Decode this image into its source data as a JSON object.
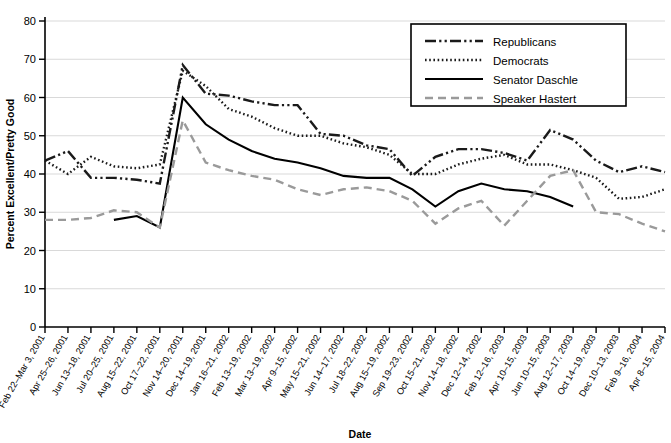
{
  "chart_data": {
    "type": "line",
    "title": "",
    "xlabel": "Date",
    "ylabel": "Percent Excellent/Pretty Good",
    "ylim": [
      0,
      80
    ],
    "yticks": [
      0,
      10,
      20,
      30,
      40,
      50,
      60,
      70,
      80
    ],
    "grid": true,
    "legend_position": "top-right",
    "categories": [
      "Feb 22–Mar 3, 2001",
      "Apr 25–26, 2001",
      "Jun 13–18, 2001",
      "Jul 20–25, 2001",
      "Aug 15–22, 2001",
      "Oct 17–22, 2001",
      "Nov 14–20, 2001",
      "Dec 14–19, 2001",
      "Jan 16–21, 2002",
      "Feb 13–19, 2002",
      "Mar 13–19, 2002",
      "Apr 9–15, 2002",
      "May 15–21, 2002",
      "Jun 14–17, 2002",
      "Jul 18–22, 2002",
      "Aug 15–19, 2002",
      "Sep 19–23, 2002",
      "Oct 15–21, 2002",
      "Nov 14–18, 2002",
      "Dec 12–14, 2002",
      "Feb 12–16, 2003",
      "Apr 10–15, 2003",
      "Jun 10–15, 2003",
      "Aug 12–17, 2003",
      "Oct 14–19, 2003",
      "Dec 10–13, 2003",
      "Feb 9–16, 2004",
      "Apr 8–15, 2004"
    ],
    "series": [
      {
        "name": "Republicans",
        "style": "dash-dot-dot",
        "color": "#1a1a1a",
        "values": [
          43.5,
          46,
          39,
          39,
          38.5,
          37.5,
          68.5,
          61,
          60.5,
          59,
          58,
          58,
          50.5,
          50,
          47.5,
          46.5,
          39.5,
          44.5,
          46.5,
          46.5,
          45.5,
          43.5,
          51.5,
          49,
          43.5,
          40.5,
          42,
          40.5
        ]
      },
      {
        "name": "Democrats",
        "style": "dotted",
        "color": "#1a1a1a",
        "values": [
          43.5,
          40,
          44.5,
          42,
          41.5,
          42.5,
          67,
          63,
          57,
          55,
          52,
          50,
          50,
          48,
          47,
          45,
          40,
          40,
          42.5,
          44,
          45,
          42.5,
          42.5,
          41,
          39,
          33.5,
          34,
          36
        ]
      },
      {
        "name": "Senator Daschle",
        "style": "solid",
        "color": "#000000",
        "values": [
          null,
          null,
          null,
          28,
          29,
          26,
          60,
          53,
          49,
          46,
          44,
          43,
          41.5,
          39.5,
          39,
          39,
          36,
          31.5,
          35.5,
          37.5,
          36,
          35.5,
          34,
          31.5,
          null,
          null,
          null,
          null
        ]
      },
      {
        "name": "Speaker Hastert",
        "style": "dashed",
        "color": "#9a9a9a",
        "values": [
          28,
          28,
          28.5,
          30.5,
          30,
          26,
          54,
          43,
          41,
          39.5,
          38.5,
          36,
          34.5,
          36,
          36.5,
          35.5,
          33,
          27,
          31,
          33,
          26.5,
          33,
          39.5,
          41,
          30,
          29.5,
          27,
          25
        ]
      }
    ]
  },
  "axes": {
    "y_title": "Percent Excellent/Pretty Good",
    "x_title": "Date",
    "y_tick_labels": [
      "0",
      "10",
      "20",
      "30",
      "40",
      "50",
      "60",
      "70",
      "80"
    ]
  },
  "legend": {
    "items": [
      {
        "label": "Republicans"
      },
      {
        "label": "Democrats"
      },
      {
        "label": "Senator Daschle"
      },
      {
        "label": "Speaker Hastert"
      }
    ]
  }
}
